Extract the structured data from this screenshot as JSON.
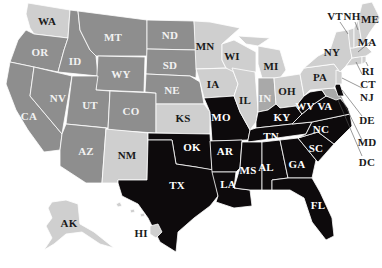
{
  "map": {
    "type": "choropleth",
    "region": "United States",
    "colors": {
      "black": "#0d0a0c",
      "dark_gray": "#8e8e8e",
      "medium_gray": "#a9a9a9",
      "light_gray": "#cfcfcf",
      "background": "#ffffff",
      "border": "#ffffff"
    },
    "states": [
      {
        "abbr": "WA",
        "shade": "light_gray"
      },
      {
        "abbr": "OR",
        "shade": "dark_gray"
      },
      {
        "abbr": "CA",
        "shade": "dark_gray"
      },
      {
        "abbr": "NV",
        "shade": "dark_gray"
      },
      {
        "abbr": "ID",
        "shade": "dark_gray"
      },
      {
        "abbr": "MT",
        "shade": "dark_gray"
      },
      {
        "abbr": "WY",
        "shade": "dark_gray"
      },
      {
        "abbr": "UT",
        "shade": "dark_gray"
      },
      {
        "abbr": "AZ",
        "shade": "dark_gray"
      },
      {
        "abbr": "CO",
        "shade": "dark_gray"
      },
      {
        "abbr": "NM",
        "shade": "light_gray"
      },
      {
        "abbr": "ND",
        "shade": "dark_gray"
      },
      {
        "abbr": "SD",
        "shade": "dark_gray"
      },
      {
        "abbr": "NE",
        "shade": "dark_gray"
      },
      {
        "abbr": "KS",
        "shade": "light_gray"
      },
      {
        "abbr": "OK",
        "shade": "black"
      },
      {
        "abbr": "TX",
        "shade": "black"
      },
      {
        "abbr": "MN",
        "shade": "light_gray"
      },
      {
        "abbr": "IA",
        "shade": "light_gray"
      },
      {
        "abbr": "MO",
        "shade": "black"
      },
      {
        "abbr": "AR",
        "shade": "black"
      },
      {
        "abbr": "LA",
        "shade": "black"
      },
      {
        "abbr": "WI",
        "shade": "light_gray"
      },
      {
        "abbr": "IL",
        "shade": "light_gray"
      },
      {
        "abbr": "MI",
        "shade": "light_gray"
      },
      {
        "abbr": "IN",
        "shade": "medium_gray"
      },
      {
        "abbr": "OH",
        "shade": "light_gray"
      },
      {
        "abbr": "KY",
        "shade": "black"
      },
      {
        "abbr": "TN",
        "shade": "black"
      },
      {
        "abbr": "MS",
        "shade": "black"
      },
      {
        "abbr": "AL",
        "shade": "black"
      },
      {
        "abbr": "GA",
        "shade": "black"
      },
      {
        "abbr": "FL",
        "shade": "black"
      },
      {
        "abbr": "SC",
        "shade": "black"
      },
      {
        "abbr": "NC",
        "shade": "black"
      },
      {
        "abbr": "VA",
        "shade": "black"
      },
      {
        "abbr": "WV",
        "shade": "black"
      },
      {
        "abbr": "MD",
        "shade": "medium_gray"
      },
      {
        "abbr": "DE",
        "shade": "black"
      },
      {
        "abbr": "DC",
        "shade": "black"
      },
      {
        "abbr": "PA",
        "shade": "light_gray"
      },
      {
        "abbr": "NJ",
        "shade": "light_gray"
      },
      {
        "abbr": "NY",
        "shade": "light_gray"
      },
      {
        "abbr": "CT",
        "shade": "light_gray"
      },
      {
        "abbr": "RI",
        "shade": "light_gray"
      },
      {
        "abbr": "MA",
        "shade": "light_gray"
      },
      {
        "abbr": "VT",
        "shade": "light_gray"
      },
      {
        "abbr": "NH",
        "shade": "light_gray"
      },
      {
        "abbr": "ME",
        "shade": "light_gray"
      },
      {
        "abbr": "AK",
        "shade": "light_gray"
      },
      {
        "abbr": "HI",
        "shade": "light_gray"
      }
    ],
    "labels": {
      "WA": "WA",
      "OR": "OR",
      "CA": "CA",
      "NV": "NV",
      "ID": "ID",
      "MT": "MT",
      "WY": "WY",
      "UT": "UT",
      "AZ": "AZ",
      "CO": "CO",
      "NM": "NM",
      "ND": "ND",
      "SD": "SD",
      "NE": "NE",
      "KS": "KS",
      "OK": "OK",
      "TX": "TX",
      "MN": "MN",
      "IA": "IA",
      "MO": "MO",
      "AR": "AR",
      "LA": "LA",
      "WI": "WI",
      "IL": "IL",
      "MI": "MI",
      "IN": "IN",
      "OH": "OH",
      "KY": "KY",
      "TN": "TN",
      "MS": "MS",
      "AL": "AL",
      "GA": "GA",
      "FL": "FL",
      "SC": "SC",
      "NC": "NC",
      "VA": "VA",
      "WV": "WV",
      "MD": "MD",
      "DE": "DE",
      "DC": "DC",
      "PA": "PA",
      "NJ": "NJ",
      "NY": "NY",
      "CT": "CT",
      "RI": "RI",
      "MA": "MA",
      "VT": "VT",
      "NH": "NH",
      "ME": "ME",
      "AK": "AK",
      "HI": "HI"
    }
  }
}
